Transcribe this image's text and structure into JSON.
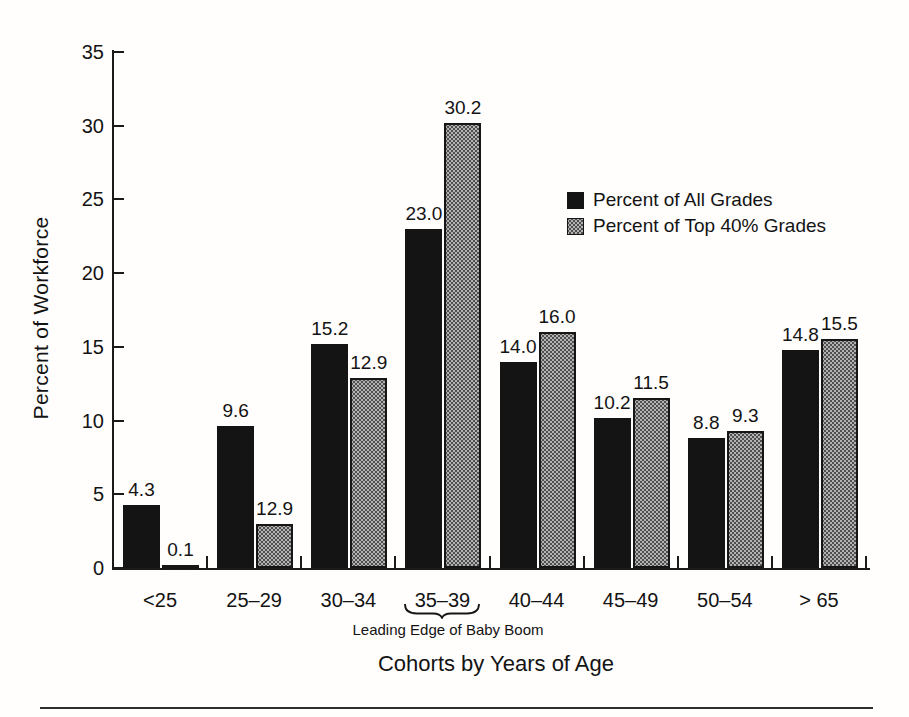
{
  "figure": {
    "background": "#ffffff",
    "bottom_rule_color": "#2e2e2e"
  },
  "chart_data": {
    "type": "bar",
    "title": "",
    "xlabel": "Cohorts by Years of Age",
    "ylabel": "Percent of Workforce",
    "ylim": [
      0,
      35
    ],
    "yticks": [
      0,
      5,
      10,
      15,
      20,
      25,
      30,
      35
    ],
    "grid": false,
    "legend_position": "inside-upper-right",
    "categories": [
      "<25",
      "25–29",
      "30–34",
      "35–39",
      "40–44",
      "45–49",
      "50–54",
      "> 65"
    ],
    "series": [
      {
        "name": "Percent of All Grades",
        "color": "#141414",
        "pattern": "solid",
        "values": [
          4.3,
          9.6,
          15.2,
          23.0,
          14.0,
          10.2,
          8.8,
          14.8
        ],
        "labels": [
          "4.3",
          "9.6",
          "15.2",
          "23.0",
          "14.0",
          "10.2",
          "8.8",
          "14.8"
        ]
      },
      {
        "name": "Percent of Top 40% Grades",
        "color": "#a9a9a9",
        "pattern": "halftone-dots",
        "values": [
          0.1,
          12.9,
          12.9,
          30.2,
          16.0,
          11.5,
          9.3,
          15.5
        ],
        "labels": [
          "0.1",
          "12.9",
          "12.9",
          "30.2",
          "16.0",
          "11.5",
          "9.3",
          "15.5"
        ],
        "drawn_values": [
          0.1,
          3.0,
          12.9,
          30.2,
          16.0,
          11.5,
          9.3,
          15.5
        ]
      }
    ],
    "annotation": {
      "text": "Leading Edge of Baby Boom",
      "target_category": "35–39"
    }
  }
}
